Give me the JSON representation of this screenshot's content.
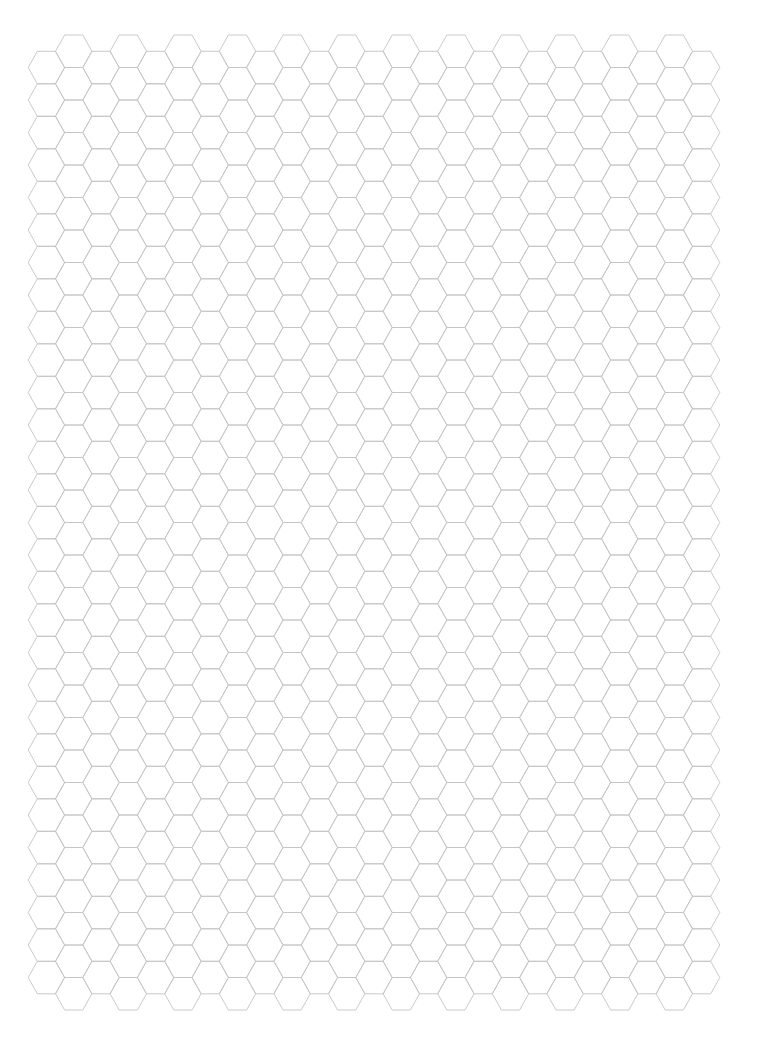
{
  "page": {
    "width": 768,
    "height": 1053,
    "background": "#ffffff"
  },
  "hex_grid": {
    "orientation": "flat-top",
    "line_color": "#c4c4c4",
    "side_x": 18.2,
    "half_height": 16.25,
    "column_period": 54.6,
    "row_period": 32.5,
    "even_columns": {
      "count": 13,
      "first_center_x": 46.4,
      "first_top_y": 51.3,
      "rows": 29
    },
    "odd_columns": {
      "count": 12,
      "first_center_x": 73.7,
      "first_top_y": 35,
      "rows": 30
    }
  }
}
